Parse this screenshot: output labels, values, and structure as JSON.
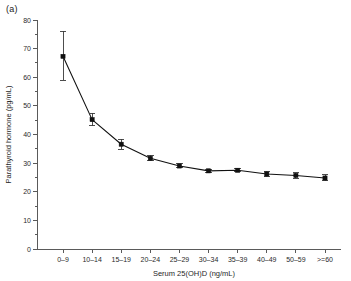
{
  "panel": {
    "label": "(a)"
  },
  "chart_data": {
    "type": "line",
    "title": "",
    "subtitle": "",
    "xlabel": "Serum 25(OH)D (ng/mL)",
    "ylabel": "Parathyroid hormone (pg/mL)",
    "categories": [
      "0–9",
      "10–14",
      "15–19",
      "20–24",
      "25–29",
      "30–34",
      "35–39",
      "40–49",
      "50–59",
      ">=60"
    ],
    "values": [
      67.3,
      45.2,
      36.6,
      31.7,
      29.0,
      27.3,
      27.5,
      26.2,
      25.7,
      24.8
    ],
    "error_low": [
      59.0,
      43.1,
      34.9,
      30.8,
      28.3,
      26.8,
      26.9,
      25.3,
      24.8,
      23.8
    ],
    "error_high": [
      76.0,
      47.4,
      38.4,
      32.7,
      29.7,
      27.9,
      28.2,
      27.1,
      26.7,
      25.9
    ],
    "ylim": [
      0,
      80
    ],
    "ytick_labels": [
      "0",
      "10",
      "20",
      "30",
      "40",
      "50",
      "60",
      "70",
      "80"
    ],
    "ytick_values": [
      0,
      10,
      20,
      30,
      40,
      50,
      60,
      70,
      80
    ],
    "yminor_values": [
      5,
      15,
      25,
      35,
      45,
      55,
      65,
      75
    ],
    "grid": false,
    "legend": "none",
    "marker": "filled-square",
    "error_bar_style": "capped-vertical",
    "line_color": "#111111",
    "marker_color": "#111111",
    "error_color": "#3a3a3a",
    "axis_color": "#5a5a5a",
    "background": "#ffffff"
  }
}
